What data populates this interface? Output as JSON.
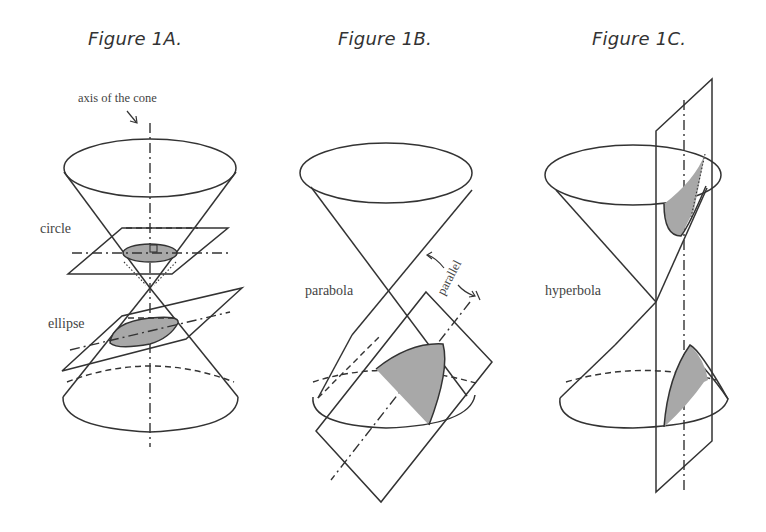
{
  "figures": [
    {
      "id": "1A",
      "title": "Figure 1A.",
      "labels": {
        "axis": "axis of the cone",
        "circle": "circle",
        "ellipse": "ellipse"
      }
    },
    {
      "id": "1B",
      "title": "Figure 1B.",
      "labels": {
        "parabola": "parabola",
        "parallel": "parallel"
      }
    },
    {
      "id": "1C",
      "title": "Figure 1C.",
      "labels": {
        "hyperbola": "hyperbola"
      }
    }
  ],
  "colors": {
    "line": "#333333",
    "shade": "#a8a8a8",
    "background": "#ffffff"
  }
}
